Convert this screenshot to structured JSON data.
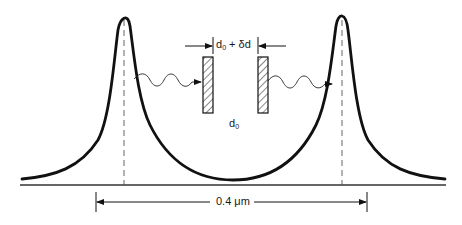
{
  "diagram": {
    "colors": {
      "ink": "#111111",
      "background": "#ffffff"
    },
    "labels": {
      "gap_top": {
        "base": "d",
        "sub": "0",
        "suffix": " + δd"
      },
      "gap_center": {
        "base": "d",
        "sub": "0"
      },
      "peak_spacing": "0.4 μm"
    },
    "elements": {
      "peaks": [
        {
          "name": "left-peak",
          "x": 124
        },
        {
          "name": "right-peak",
          "x": 342
        }
      ],
      "mirrors": [
        {
          "name": "left-mirror",
          "x": 203
        },
        {
          "name": "right-mirror",
          "x": 258
        }
      ],
      "waves": [
        {
          "name": "incoming-wave",
          "direction": "right"
        },
        {
          "name": "outgoing-wave",
          "direction": "right"
        }
      ]
    }
  }
}
